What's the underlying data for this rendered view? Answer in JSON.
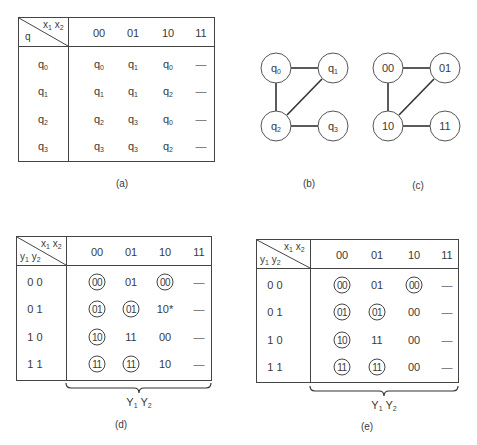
{
  "panel_a": {
    "caption": "(a)",
    "corner_top": "x1 x2",
    "corner_bottom": "q",
    "columns": [
      "00",
      "01",
      "10",
      "11"
    ],
    "rows": [
      {
        "state": "q0",
        "cells": [
          "q0",
          "q1",
          "q0",
          "—"
        ]
      },
      {
        "state": "q1",
        "cells": [
          "q1",
          "q1",
          "q2",
          "—"
        ]
      },
      {
        "state": "q2",
        "cells": [
          "q2",
          "q3",
          "q0",
          "—"
        ]
      },
      {
        "state": "q3",
        "cells": [
          "q3",
          "q3",
          "q2",
          "—"
        ]
      }
    ]
  },
  "panel_b": {
    "caption": "(b)",
    "nodes": [
      "q0",
      "q1",
      "q2",
      "q3"
    ],
    "edges": [
      [
        "q0",
        "q1"
      ],
      [
        "q0",
        "q2"
      ],
      [
        "q1",
        "q2"
      ],
      [
        "q2",
        "q3"
      ]
    ]
  },
  "panel_c": {
    "caption": "(c)",
    "nodes": [
      "00",
      "01",
      "10",
      "11"
    ],
    "edges": [
      [
        "00",
        "01"
      ],
      [
        "00",
        "10"
      ],
      [
        "01",
        "10"
      ],
      [
        "10",
        "11"
      ]
    ]
  },
  "panel_d": {
    "caption": "(d)",
    "corner_top": "x1 x2",
    "corner_bottom": "y1 y2",
    "columns": [
      "00",
      "01",
      "10",
      "11"
    ],
    "brace_label": "Y1 Y2",
    "rows": [
      {
        "state": "0 0",
        "cells": [
          {
            "v": "00",
            "stable": true
          },
          {
            "v": "01",
            "stable": false
          },
          {
            "v": "00",
            "stable": true
          },
          {
            "v": "—",
            "stable": false
          }
        ]
      },
      {
        "state": "0 1",
        "cells": [
          {
            "v": "01",
            "stable": true
          },
          {
            "v": "01",
            "stable": true
          },
          {
            "v": "10*",
            "stable": false
          },
          {
            "v": "—",
            "stable": false
          }
        ]
      },
      {
        "state": "1 0",
        "cells": [
          {
            "v": "10",
            "stable": true
          },
          {
            "v": "11",
            "stable": false
          },
          {
            "v": "00",
            "stable": false
          },
          {
            "v": "—",
            "stable": false
          }
        ]
      },
      {
        "state": "1 1",
        "cells": [
          {
            "v": "11",
            "stable": true
          },
          {
            "v": "11",
            "stable": true
          },
          {
            "v": "10",
            "stable": false
          },
          {
            "v": "—",
            "stable": false
          }
        ]
      }
    ]
  },
  "panel_e": {
    "caption": "(e)",
    "corner_top": "x1 x2",
    "corner_bottom": "y1 y2",
    "columns": [
      "00",
      "01",
      "10",
      "11"
    ],
    "brace_label": "Y1 Y2",
    "rows": [
      {
        "state": "0 0",
        "cells": [
          {
            "v": "00",
            "stable": true
          },
          {
            "v": "01",
            "stable": false
          },
          {
            "v": "00",
            "stable": true
          },
          {
            "v": "—",
            "stable": false
          }
        ]
      },
      {
        "state": "0 1",
        "cells": [
          {
            "v": "01",
            "stable": true
          },
          {
            "v": "01",
            "stable": true
          },
          {
            "v": "00",
            "stable": false
          },
          {
            "v": "—",
            "stable": false
          }
        ]
      },
      {
        "state": "1 0",
        "cells": [
          {
            "v": "10",
            "stable": true
          },
          {
            "v": "11",
            "stable": false
          },
          {
            "v": "00",
            "stable": false
          },
          {
            "v": "—",
            "stable": false
          }
        ]
      },
      {
        "state": "1 1",
        "cells": [
          {
            "v": "11",
            "stable": true
          },
          {
            "v": "11",
            "stable": true
          },
          {
            "v": "00",
            "stable": false
          },
          {
            "v": "—",
            "stable": false
          }
        ]
      }
    ]
  }
}
